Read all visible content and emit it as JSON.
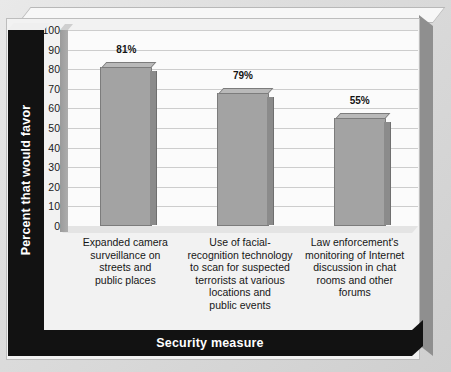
{
  "chart_data": {
    "type": "bar",
    "title": "",
    "xlabel": "Security measure",
    "ylabel": "Percent that would favor",
    "categories": [
      "Expanded camera surveillance on streets and public places",
      "Use of facial-recognition technology to scan for suspected terrorists at various locations and public events",
      "Law enforcement's monitoring of Internet discussion in chat rooms and other forums"
    ],
    "values": [
      81,
      79,
      55
    ],
    "bar_pixel_tops": [
      81,
      68,
      55
    ],
    "data_labels": [
      "81%",
      "79%",
      "55%"
    ],
    "ylim": [
      0,
      100
    ],
    "yticks": [
      100,
      90,
      80,
      70,
      60,
      50,
      40,
      30,
      20,
      10,
      0
    ],
    "ytick_labels": [
      "100",
      "90",
      "80",
      "70",
      "60",
      "50",
      "40",
      "30",
      "20",
      "10",
      "0"
    ],
    "grid": true,
    "legend": "none",
    "style": "3d-bar"
  },
  "axis": {
    "y_title": "Percent that would favor",
    "x_title": "Security measure"
  },
  "categories_wrapped": [
    [
      "Expanded camera",
      "surveillance on",
      "streets and",
      "public places"
    ],
    [
      "Use of facial-",
      "recognition technology",
      "to scan for suspected",
      "terrorists at various",
      "locations and",
      "public events"
    ],
    [
      "Law enforcement's",
      "monitoring of Internet",
      "discussion in chat",
      "rooms and other",
      "forums"
    ]
  ],
  "colors": {
    "bar_face": "#a3a3a3",
    "bar_side": "#8b8b8b",
    "bar_cap": "#b9b9b9",
    "bar_outline": "#7c7c7c",
    "axis_bar": "#121212",
    "axis_bar_text": "#ffffff",
    "plot_background": "#fbfbfb",
    "gridline": "#cdcdcd",
    "figure_background": "#f2f2f2",
    "outer_background": "#d9d9d9"
  }
}
